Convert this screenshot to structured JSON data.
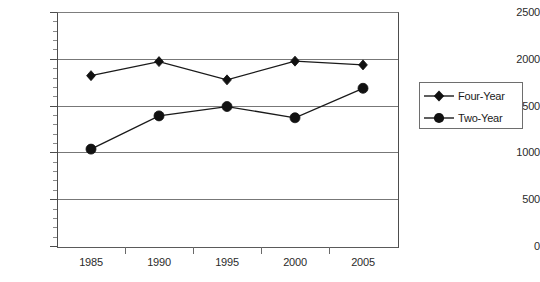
{
  "chart_data": {
    "type": "line",
    "title": "",
    "subtitle": "",
    "xlabel": "",
    "ylabel": "",
    "categories": [
      "1985",
      "1990",
      "1995",
      "2000",
      "2005"
    ],
    "series": [
      {
        "name": "Four-Year",
        "marker": "diamond",
        "values": [
          1820,
          1970,
          1775,
          1975,
          1935
        ]
      },
      {
        "name": "Two-Year",
        "marker": "circle",
        "values": [
          1035,
          1390,
          1490,
          1370,
          1685
        ]
      }
    ],
    "ylim": [
      0,
      2500
    ],
    "y_ticks": [
      0,
      500,
      1000,
      1500,
      2000,
      2500
    ],
    "y_tick_labels": [
      "0",
      "500",
      "1000",
      "1500",
      "2000",
      "2500"
    ],
    "y_minor_tick_step": 100,
    "x_tick_labels": [
      "1985",
      "1990",
      "1995",
      "2000",
      "2005"
    ],
    "grid": "horizontal",
    "legend_position": "right",
    "legend_entries": [
      "Four-Year",
      "Two-Year"
    ],
    "colors": {
      "series_line": "#1a1a1a",
      "marker": "#111111",
      "gridline": "#777777",
      "axis": "#4d4d4d",
      "text": "#2b2b2b",
      "background": "#ffffff"
    }
  }
}
